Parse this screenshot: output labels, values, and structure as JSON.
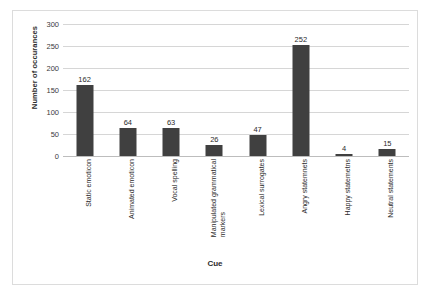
{
  "chart_data": {
    "type": "bar",
    "title": "",
    "xlabel": "Cue",
    "ylabel": "Number of occurances",
    "categories": [
      "Static emoticon",
      "Animated emoticon",
      "Vocal spelling",
      "Manipulated grammatical\nmarkers",
      "Lexical surrogates",
      "Angry statemnets",
      "Happy statemetns",
      "Neutral statements"
    ],
    "values": [
      162,
      64,
      63,
      26,
      47,
      252,
      4,
      15
    ],
    "value_labels": [
      "162",
      "64",
      "63",
      "26",
      "47",
      "252",
      "4",
      "15"
    ],
    "ylim": [
      0,
      300
    ],
    "yticks": [
      0,
      50,
      100,
      150,
      200,
      250,
      300
    ],
    "ytick_labels": [
      "0",
      "50",
      "100",
      "150",
      "200",
      "250",
      "300"
    ],
    "grid": true,
    "legend": false,
    "bar_color": "#404040",
    "gridline_color": "#d6d6d6",
    "frame_color": "#dcdcdc",
    "background_color": "#ffffff"
  }
}
